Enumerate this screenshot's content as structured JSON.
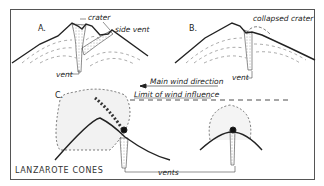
{
  "diagram": {
    "title": "LANZAROTE CONES",
    "panels": [
      {
        "id": "A",
        "letter": "A.",
        "labels": {
          "crater": "crater",
          "side_vent": "side vent",
          "vent": "vent"
        }
      },
      {
        "id": "B",
        "letter": "B.",
        "labels": {
          "collapsed_crater": "collapsed crater",
          "vent": "vent"
        }
      },
      {
        "id": "C",
        "letter": "C.",
        "labels": {
          "vents": "vents"
        }
      }
    ],
    "wind": {
      "direction_label": "Main wind direction",
      "limit_label": "Limit of wind influence"
    },
    "colors": {
      "ink": "#222222",
      "frame": "#555555",
      "background": "#ffffff"
    }
  }
}
